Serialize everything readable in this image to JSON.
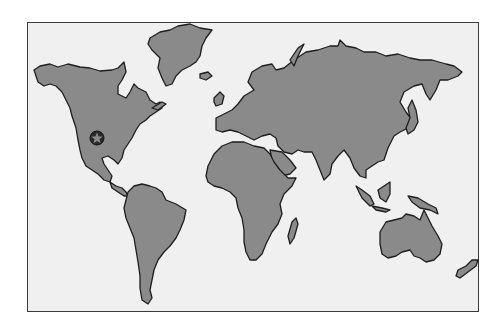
{
  "map": {
    "type": "world-map",
    "projection": "flat outline",
    "colors": {
      "background_outside": "#ffffff",
      "ocean": "#f0f0f0",
      "land": "#8a8a8a",
      "outline": "#1e1e1e",
      "frame": "#3a3a3a"
    },
    "continents": [
      "North America",
      "Greenland",
      "South America",
      "Europe",
      "Africa",
      "Asia",
      "Australia",
      "New Zealand"
    ],
    "marker": {
      "icon": "star-in-circle-icon",
      "location": "central United States",
      "x": 97,
      "y": 138
    }
  }
}
